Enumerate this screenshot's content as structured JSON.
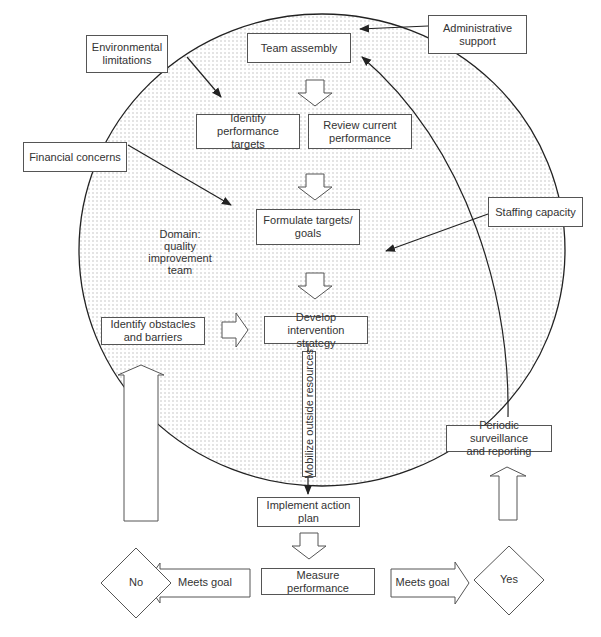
{
  "diagram": {
    "domain_label": "Domain:\nquality\nimprovement\nteam",
    "domain_lines": [
      "Domain:",
      "quality",
      "improvement",
      "team"
    ],
    "external_factors": {
      "environmental": [
        "Environmental",
        "limitations"
      ],
      "financial": [
        "Financial concerns"
      ],
      "administrative": [
        "Administrative",
        "support"
      ],
      "staffing": [
        "Staffing capacity"
      ]
    },
    "steps": {
      "team_assembly": [
        "Team assembly"
      ],
      "identify_targets": [
        "Identify performance",
        "targets"
      ],
      "review_performance": [
        "Review current",
        "performance"
      ],
      "formulate_goals": [
        "Formulate targets/",
        "goals"
      ],
      "identify_obstacles": [
        "Identify obstacles",
        "and barriers"
      ],
      "develop_strategy": [
        "Develop intervention",
        "strategy"
      ],
      "mobilize_resources": "Mobilize outside resources",
      "implement_plan": [
        "Implement action",
        "plan"
      ],
      "measure_performance": [
        "Measure performance"
      ],
      "periodic_surveillance": [
        "Periodic surveillance",
        "and reporting"
      ]
    },
    "decisions": {
      "no": "No",
      "yes": "Yes",
      "left_arrow_label": "Meets goal",
      "right_arrow_label": "Meets goal"
    },
    "colors": {
      "line": "#333333",
      "box_border": "#555555",
      "dot_fill": "#bbbbbb"
    }
  }
}
